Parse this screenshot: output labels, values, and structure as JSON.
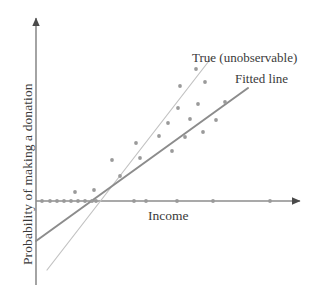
{
  "chart_data": {
    "type": "scatter",
    "title": "",
    "xlabel": "Income",
    "ylabel": "Probability of making a donation",
    "xlim": [
      0,
      100
    ],
    "ylim": [
      -0.45,
      1.0
    ],
    "grid": false,
    "legend_position": "upper-right-inline",
    "annotations": [
      {
        "name": "true-line-label",
        "text": "True (unobservable)",
        "x_px": 192,
        "y_px": 50
      },
      {
        "name": "fitted-line-label",
        "text": "Fitted line",
        "x_px": 235,
        "y_px": 71
      }
    ],
    "series": [
      {
        "name": "observations",
        "type": "scatter",
        "marker": "circle",
        "color": "#9a9a9a",
        "points_px": [
          [
            42,
            201
          ],
          [
            50,
            201
          ],
          [
            57,
            201
          ],
          [
            64,
            201
          ],
          [
            71,
            201
          ],
          [
            78,
            201
          ],
          [
            85,
            201
          ],
          [
            92,
            201
          ],
          [
            96,
            201
          ],
          [
            134,
            201
          ],
          [
            146,
            201
          ],
          [
            177,
            201
          ],
          [
            213,
            201
          ],
          [
            270,
            201
          ],
          [
            75,
            192
          ],
          [
            94,
            190
          ],
          [
            120,
            176
          ],
          [
            112,
            160
          ],
          [
            140,
            158
          ],
          [
            172,
            151
          ],
          [
            136,
            143
          ],
          [
            159,
            136
          ],
          [
            185,
            137
          ],
          [
            203,
            132
          ],
          [
            168,
            123
          ],
          [
            190,
            119
          ],
          [
            216,
            120
          ],
          [
            178,
            108
          ],
          [
            198,
            104
          ],
          [
            225,
            102
          ],
          [
            180,
            86
          ],
          [
            205,
            82
          ],
          [
            196,
            69
          ]
        ]
      },
      {
        "name": "True (unobservable)",
        "type": "line",
        "color": "#c2c2c2",
        "width_px": 1.2,
        "endpoints_px": [
          [
            47,
            270
          ],
          [
            212,
            57
          ]
        ]
      },
      {
        "name": "Fitted line",
        "type": "line",
        "color": "#8c8c8c",
        "width_px": 2.0,
        "endpoints_px": [
          [
            36,
            241
          ],
          [
            248,
            88
          ]
        ]
      }
    ],
    "axes": {
      "x_axis_px": {
        "x1": 36,
        "y1": 201,
        "x2": 300,
        "y2": 201,
        "arrow": "right"
      },
      "y_axis_px": {
        "x1": 36,
        "y1": 285,
        "x2": 36,
        "y2": 18,
        "arrow": "up"
      },
      "color": "#8d8d8d"
    }
  },
  "colors": {
    "background": "#ffffff",
    "axis": "#8d8d8d",
    "point": "#9a9a9a",
    "true_line": "#c2c2c2",
    "fitted_line": "#8c8c8c",
    "text": "#3a3a3a"
  }
}
